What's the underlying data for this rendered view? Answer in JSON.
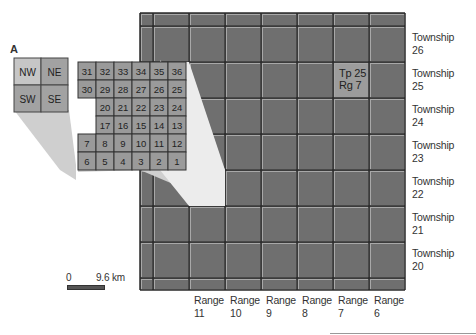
{
  "diagram": {
    "inset_label": "A",
    "quarters": [
      {
        "id": "nw",
        "label": "NW"
      },
      {
        "id": "ne",
        "label": "NE"
      },
      {
        "id": "sw",
        "label": "SW"
      },
      {
        "id": "se",
        "label": "SE"
      }
    ],
    "sections": [
      [
        31,
        32,
        33,
        34,
        35,
        36
      ],
      [
        30,
        29,
        28,
        27,
        26,
        25
      ],
      [
        19,
        20,
        21,
        22,
        23,
        24
      ],
      [
        18,
        17,
        16,
        15,
        14,
        13
      ],
      [
        7,
        8,
        9,
        10,
        11,
        12
      ],
      [
        6,
        5,
        4,
        3,
        2,
        1
      ]
    ],
    "highlighted_cell": {
      "line1": "Tp 25",
      "line2": "Rg 7"
    },
    "townships": [
      {
        "word": "Township",
        "num": "26"
      },
      {
        "word": "Township",
        "num": "25"
      },
      {
        "word": "Township",
        "num": "24"
      },
      {
        "word": "Township",
        "num": "23"
      },
      {
        "word": "Township",
        "num": "22"
      },
      {
        "word": "Township",
        "num": "21"
      },
      {
        "word": "Township",
        "num": "20"
      }
    ],
    "ranges": [
      {
        "word": "Range",
        "num": "11"
      },
      {
        "word": "Range",
        "num": "10"
      },
      {
        "word": "Range",
        "num": "9"
      },
      {
        "word": "Range",
        "num": "8"
      },
      {
        "word": "Range",
        "num": "7"
      },
      {
        "word": "Range",
        "num": "6"
      }
    ],
    "scale": {
      "start": "0",
      "end": "9.6 km"
    },
    "colors": {
      "grid_fill": "#6f6f6f",
      "grid_line_dark": "#2a2a2a",
      "grid_line_light": "#a8a8a8",
      "highlight": "#9c9c9c",
      "section_fill": "#9a9a9a",
      "quarter_nw": "#c6c6c6",
      "quarter_other": "#a2a2a2",
      "wedge_light": "#ececec",
      "wedge_mid": "#cfcfcf"
    }
  }
}
